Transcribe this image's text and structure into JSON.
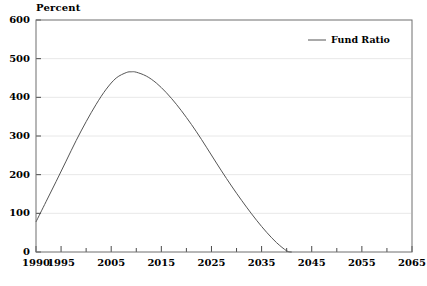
{
  "chart_data": {
    "type": "line",
    "title": "",
    "subtitle": "",
    "xlabel": "",
    "ylabel": "Percent",
    "ylabel_position": "top-left",
    "xlim": [
      1990,
      2065
    ],
    "ylim": [
      0,
      600
    ],
    "grid": true,
    "grid_axis": "y",
    "legend_position": "top-right",
    "y_ticks": [
      0,
      100,
      200,
      300,
      400,
      500,
      600
    ],
    "y_tick_labels": [
      "0",
      "100",
      "200",
      "300",
      "400",
      "500",
      "600"
    ],
    "x_ticks_major": [
      1990,
      1995,
      2005,
      2015,
      2025,
      2035,
      2045,
      2055,
      2065
    ],
    "x_tick_labels": [
      "1990",
      "1995",
      "2005",
      "2015",
      "2025",
      "2035",
      "2045",
      "2055",
      "2065"
    ],
    "x_ticks_minor": [
      2000,
      2010,
      2020,
      2030,
      2040,
      2050,
      2060
    ],
    "series": [
      {
        "name": "Fund Ratio",
        "color": "#555555",
        "x": [
          1990,
          1992,
          1994,
          1996,
          1998,
          2000,
          2002,
          2004,
          2006,
          2008,
          2009,
          2010,
          2012,
          2014,
          2016,
          2018,
          2020,
          2022,
          2024,
          2026,
          2028,
          2030,
          2032,
          2034,
          2036,
          2038,
          2040,
          2041
        ],
        "values": [
          78,
          130,
          182,
          235,
          288,
          337,
          382,
          421,
          450,
          464,
          466,
          465,
          455,
          437,
          412,
          382,
          348,
          311,
          271,
          230,
          190,
          152,
          116,
          82,
          51,
          24,
          3,
          0
        ]
      }
    ],
    "annotations": []
  },
  "legend": {
    "entries": [
      {
        "label": "Fund Ratio"
      }
    ]
  }
}
